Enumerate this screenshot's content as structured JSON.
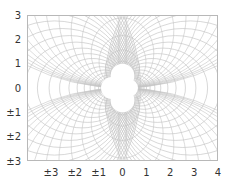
{
  "chart_data": {
    "type": "contour",
    "title": "",
    "xlabel": "",
    "ylabel": "",
    "xlim": [
      -4,
      4
    ],
    "ylim": [
      -3,
      3
    ],
    "grid": false,
    "legend": null,
    "x_ticks": [
      {
        "value": -3,
        "label": "±3"
      },
      {
        "value": -2,
        "label": "±2"
      },
      {
        "value": -1,
        "label": "±1"
      },
      {
        "value": 0,
        "label": "0"
      },
      {
        "value": 1,
        "label": "1"
      },
      {
        "value": 2,
        "label": "2"
      },
      {
        "value": 3,
        "label": "3"
      },
      {
        "value": 4,
        "label": "4"
      }
    ],
    "y_ticks": [
      {
        "value": 3,
        "label": "3"
      },
      {
        "value": 2,
        "label": "2"
      },
      {
        "value": 1,
        "label": "1"
      },
      {
        "value": 0,
        "label": "0"
      },
      {
        "value": -1,
        "label": "±1"
      },
      {
        "value": -2,
        "label": "±2"
      },
      {
        "value": -3,
        "label": "±3"
      }
    ],
    "excluded_circles": [
      {
        "cx": 0.0,
        "cy": 0.5,
        "r": 0.5
      },
      {
        "cx": 0.0,
        "cy": -0.5,
        "r": 0.5
      },
      {
        "cx": -0.45,
        "cy": 0.0,
        "r": 0.45
      },
      {
        "cx": 0.3,
        "cy": 0.0,
        "r": 0.35
      }
    ],
    "line_color": "#bdbdbd",
    "frame_color": "#b8b8b8"
  }
}
